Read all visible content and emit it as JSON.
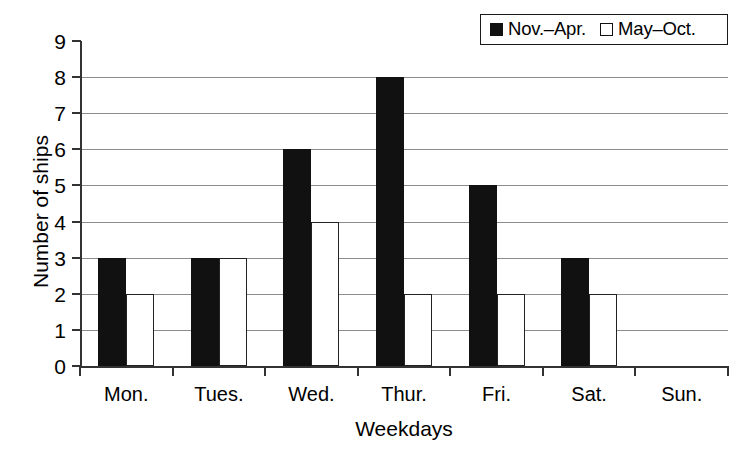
{
  "chart_data": {
    "type": "bar",
    "title": "",
    "xlabel": "Weekdays",
    "ylabel": "Number of ships",
    "categories": [
      "Mon.",
      "Tues.",
      "Wed.",
      "Thur.",
      "Fri.",
      "Sat.",
      "Sun."
    ],
    "series": [
      {
        "name": "Nov.–Apr.",
        "values": [
          3,
          3,
          6,
          8,
          5,
          3,
          0
        ],
        "color": "#111111",
        "swatch": "filled"
      },
      {
        "name": "May–Oct.",
        "values": [
          2,
          3,
          4,
          2,
          2,
          2,
          0
        ],
        "color": "#ffffff",
        "swatch": "hollow"
      }
    ],
    "ylim": [
      0,
      9
    ],
    "yticks": [
      0,
      1,
      2,
      3,
      4,
      5,
      6,
      7,
      8,
      9
    ],
    "ytick_labels": [
      "0",
      "1",
      "2",
      "3",
      "4",
      "5",
      "6",
      "7",
      "8",
      "9"
    ],
    "grid": true,
    "grid_axis": "y",
    "legend_position": "top-right"
  },
  "legend": {
    "entries": [
      {
        "label": "Nov.–Apr."
      },
      {
        "label": "May–Oct."
      }
    ]
  },
  "axes": {
    "x_title": "Weekdays",
    "y_title": "Number of ships"
  }
}
